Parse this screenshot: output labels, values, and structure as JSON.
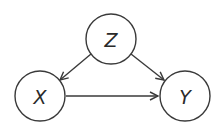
{
  "diagram": {
    "type": "causal-dag",
    "nodes": [
      {
        "id": "Z",
        "label": "Z",
        "cx": 111,
        "cy": 39,
        "r": 25
      },
      {
        "id": "X",
        "label": "X",
        "cx": 40,
        "cy": 96,
        "r": 25
      },
      {
        "id": "Y",
        "label": "Y",
        "cx": 185,
        "cy": 96,
        "r": 25
      }
    ],
    "edges": [
      {
        "from": "Z",
        "to": "X"
      },
      {
        "from": "Z",
        "to": "Y"
      },
      {
        "from": "X",
        "to": "Y"
      }
    ],
    "colors": {
      "stroke": "#3a3a3a",
      "label": "#2a2a2a",
      "background": "#ffffff"
    }
  }
}
